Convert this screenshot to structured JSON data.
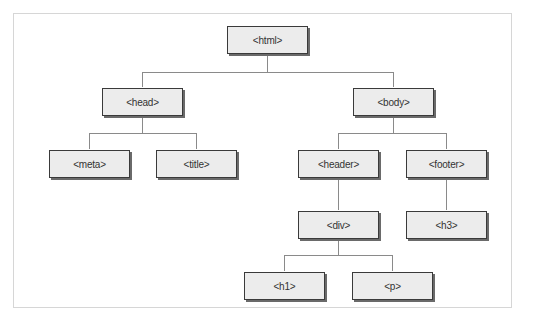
{
  "diagram": {
    "type": "tree",
    "nodes": [
      {
        "id": "html",
        "label": "<html>",
        "parent": null
      },
      {
        "id": "head",
        "label": "<head>",
        "parent": "html"
      },
      {
        "id": "body",
        "label": "<body>",
        "parent": "html"
      },
      {
        "id": "meta",
        "label": "<meta>",
        "parent": "head"
      },
      {
        "id": "title",
        "label": "<title>",
        "parent": "head"
      },
      {
        "id": "header",
        "label": "<header>",
        "parent": "body"
      },
      {
        "id": "footer",
        "label": "<footer>",
        "parent": "body"
      },
      {
        "id": "div",
        "label": "<div>",
        "parent": "header"
      },
      {
        "id": "h3",
        "label": "<h3>",
        "parent": "footer"
      },
      {
        "id": "h1",
        "label": "<h1>",
        "parent": "div"
      },
      {
        "id": "p",
        "label": "<p>",
        "parent": "div"
      }
    ]
  },
  "labels": {
    "html": "<html>",
    "head": "<head>",
    "body": "<body>",
    "meta": "<meta>",
    "title": "<title>",
    "header": "<header>",
    "footer": "<footer>",
    "div": "<div>",
    "h3": "<h3>",
    "h1": "<h1>",
    "p": "<p>"
  },
  "colors": {
    "node_fill": "#ececec",
    "node_border": "#3a3a3a",
    "connector": "#8a8a8a",
    "frame_border": "#d6d6d6"
  }
}
